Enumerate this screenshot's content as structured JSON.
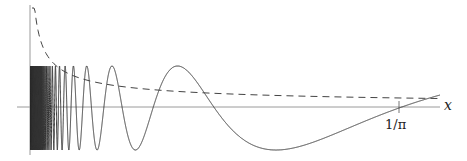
{
  "chart_data": {
    "type": "line",
    "title": "",
    "xlabel": "x",
    "ylabel": "",
    "x_ticks": [
      {
        "value": 0.3183,
        "label": "1/π"
      }
    ],
    "xlim": [
      0,
      0.354
    ],
    "series": [
      {
        "name": "sin(1/x)",
        "style": "solid",
        "formula": "sin(1/x)",
        "amplitude": 1
      },
      {
        "name": "decaying envelope",
        "style": "dashed",
        "formula": "c/sqrt(x)"
      }
    ],
    "grid": false,
    "legend": "none"
  },
  "axes": {
    "x_label": "x",
    "tick_label": "1/π"
  },
  "colors": {
    "curve": "#333333",
    "axis": "#999999",
    "dashed": "#444444"
  }
}
